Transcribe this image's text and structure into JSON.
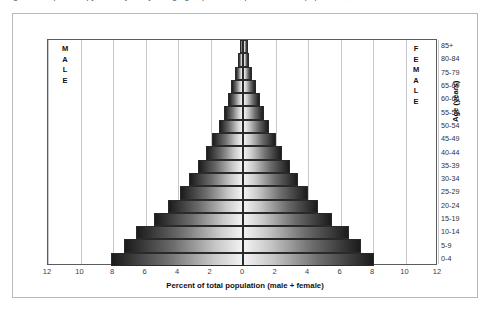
{
  "top_caption": "Figure 1. Population pyramid by five-year age group and sex, percent of total population, 2010",
  "labels": {
    "male": "MALE",
    "female": "FEMALE",
    "x_axis_title": "Percent of total population (male + female)",
    "y_axis_title": "Age (years)"
  },
  "chart_data": {
    "type": "bar",
    "subtype": "population-pyramid",
    "title": "",
    "xlabel": "Percent of total population (male + female)",
    "ylabel": "Age (years)",
    "xlim": [
      -12,
      12
    ],
    "xticks": [
      "12",
      "10",
      "8",
      "6",
      "4",
      "2",
      "0",
      "2",
      "4",
      "6",
      "8",
      "10",
      "12"
    ],
    "xtick_values": [
      -12,
      -10,
      -8,
      -6,
      -4,
      -2,
      0,
      2,
      4,
      6,
      8,
      10,
      12
    ],
    "grid": true,
    "legend": "none",
    "categories": [
      "0-4",
      "5-9",
      "10-14",
      "15-19",
      "20-24",
      "25-29",
      "30-34",
      "35-39",
      "40-44",
      "45-49",
      "50-54",
      "55-59",
      "60-64",
      "65-69",
      "75-79",
      "80-84",
      "85+"
    ],
    "axis_tick_labels_top_to_bottom": [
      "85+",
      "80-84",
      "75-79",
      "65-69",
      "60-64",
      "55-59",
      "50-54",
      "45-49",
      "40-44",
      "35-39",
      "30-34",
      "25-29",
      "20-24",
      "15-19",
      "10-14",
      "5-9",
      "0-4"
    ],
    "series": [
      {
        "name": "Male",
        "side": "left",
        "values": [
          8.1,
          7.3,
          6.6,
          5.5,
          4.6,
          3.9,
          3.3,
          2.8,
          2.3,
          1.9,
          1.5,
          1.2,
          0.95,
          0.72,
          0.5,
          0.3,
          0.2
        ]
      },
      {
        "name": "Female",
        "side": "right",
        "values": [
          8.05,
          7.25,
          6.5,
          5.45,
          4.6,
          4.0,
          3.4,
          2.9,
          2.4,
          2.0,
          1.6,
          1.3,
          1.05,
          0.8,
          0.58,
          0.38,
          0.3
        ]
      }
    ]
  }
}
